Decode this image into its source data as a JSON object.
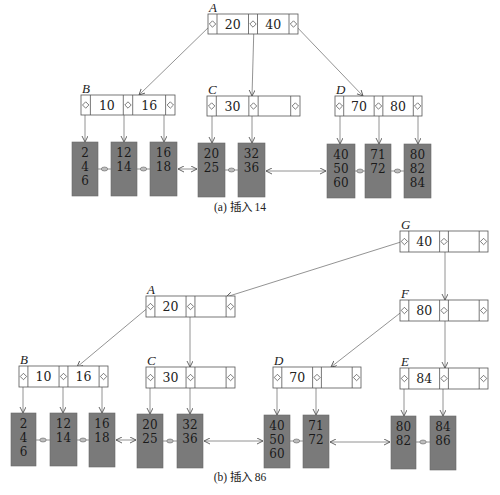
{
  "figure": {
    "parts": [
      {
        "id": "a",
        "caption": "(a) 插入 14",
        "caption_pos": [
          240,
          211
        ],
        "nodes": [
          {
            "name": "A",
            "x": 208,
            "y": 14,
            "w": 90,
            "h": 20,
            "keys": [
              "20",
              "40"
            ]
          },
          {
            "name": "B",
            "x": 81,
            "y": 95,
            "w": 94,
            "h": 20,
            "keys": [
              "10",
              "16"
            ]
          },
          {
            "name": "C",
            "x": 207,
            "y": 96,
            "w": 93,
            "h": 20,
            "keys": [
              "30",
              ""
            ]
          },
          {
            "name": "D",
            "x": 335,
            "y": 96,
            "w": 87,
            "h": 20,
            "keys": [
              "70",
              "80"
            ]
          }
        ],
        "leaves": [
          {
            "x": 72,
            "y": 142,
            "w": 26,
            "h": 54,
            "values": [
              "2",
              "4",
              "6"
            ]
          },
          {
            "x": 111,
            "y": 142,
            "w": 26,
            "h": 54,
            "values": [
              "12",
              "14"
            ]
          },
          {
            "x": 150,
            "y": 142,
            "w": 27,
            "h": 54,
            "values": [
              "16",
              "18"
            ]
          },
          {
            "x": 198,
            "y": 143,
            "w": 27,
            "h": 54,
            "values": [
              "20",
              "25"
            ]
          },
          {
            "x": 238,
            "y": 143,
            "w": 27,
            "h": 54,
            "values": [
              "32",
              "36"
            ]
          },
          {
            "x": 327,
            "y": 144,
            "w": 28,
            "h": 54,
            "values": [
              "40",
              "50",
              "60"
            ]
          },
          {
            "x": 365,
            "y": 144,
            "w": 26,
            "h": 54,
            "values": [
              "71",
              "72"
            ]
          },
          {
            "x": 404,
            "y": 144,
            "w": 27,
            "h": 54,
            "values": [
              "80",
              "82",
              "84"
            ]
          }
        ],
        "edges": [
          {
            "from": [
              212,
              24
            ],
            "to": [
              139,
              95
            ]
          },
          {
            "from": [
              254,
              24
            ],
            "to": [
              252,
              96
            ]
          },
          {
            "from": [
              294,
              24
            ],
            "to": [
              363,
              96
            ]
          },
          {
            "from": [
              85,
              105
            ],
            "to": [
              85,
              142
            ]
          },
          {
            "from": [
              124,
              105
            ],
            "to": [
              124,
              142
            ]
          },
          {
            "from": [
              164,
              105
            ],
            "to": [
              164,
              142
            ]
          },
          {
            "from": [
              212,
              106
            ],
            "to": [
              212,
              143
            ]
          },
          {
            "from": [
              252,
              106
            ],
            "to": [
              252,
              143
            ]
          },
          {
            "from": [
              340,
              106
            ],
            "to": [
              340,
              144
            ]
          },
          {
            "from": [
              379,
              106
            ],
            "to": [
              379,
              144
            ]
          },
          {
            "from": [
              418,
              106
            ],
            "to": [
              418,
              144
            ]
          }
        ],
        "sibling_links": [
          {
            "x1": 98,
            "x2": 111,
            "y": 169,
            "type": "dot"
          },
          {
            "x1": 137,
            "x2": 150,
            "y": 169,
            "type": "dot"
          },
          {
            "x1": 177,
            "x2": 198,
            "y": 169,
            "type": "arrows"
          },
          {
            "x1": 225,
            "x2": 238,
            "y": 170,
            "type": "dot"
          },
          {
            "x1": 265,
            "x2": 327,
            "y": 171,
            "type": "arrows"
          },
          {
            "x1": 355,
            "x2": 365,
            "y": 171,
            "type": "dot"
          },
          {
            "x1": 391,
            "x2": 404,
            "y": 171,
            "type": "dot"
          }
        ]
      },
      {
        "id": "b",
        "caption": "(b) 插入 86",
        "caption_pos": [
          240,
          481
        ],
        "nodes": [
          {
            "name": "G",
            "x": 400,
            "y": 231,
            "w": 88,
            "h": 21,
            "keys": [
              "40",
              ""
            ]
          },
          {
            "name": "A",
            "x": 146,
            "y": 296,
            "w": 89,
            "h": 21,
            "keys": [
              "20",
              ""
            ]
          },
          {
            "name": "F",
            "x": 400,
            "y": 300,
            "w": 88,
            "h": 21,
            "keys": [
              "80",
              ""
            ]
          },
          {
            "name": "B",
            "x": 19,
            "y": 366,
            "w": 89,
            "h": 21,
            "keys": [
              "10",
              "16"
            ]
          },
          {
            "name": "C",
            "x": 146,
            "y": 367,
            "w": 89,
            "h": 21,
            "keys": [
              "30",
              ""
            ]
          },
          {
            "name": "D",
            "x": 273,
            "y": 367,
            "w": 88,
            "h": 21,
            "keys": [
              "70",
              ""
            ]
          },
          {
            "name": "E",
            "x": 400,
            "y": 368,
            "w": 88,
            "h": 21,
            "keys": [
              "84",
              ""
            ]
          }
        ],
        "leaves": [
          {
            "x": 11,
            "y": 413,
            "w": 25,
            "h": 53,
            "values": [
              "2",
              "4",
              "6"
            ]
          },
          {
            "x": 50,
            "y": 413,
            "w": 27,
            "h": 53,
            "values": [
              "12",
              "14"
            ]
          },
          {
            "x": 89,
            "y": 413,
            "w": 26,
            "h": 54,
            "values": [
              "16",
              "18"
            ]
          },
          {
            "x": 137,
            "y": 414,
            "w": 26,
            "h": 54,
            "values": [
              "20",
              "25"
            ]
          },
          {
            "x": 177,
            "y": 414,
            "w": 26,
            "h": 54,
            "values": [
              "32",
              "36"
            ]
          },
          {
            "x": 264,
            "y": 415,
            "w": 26,
            "h": 53,
            "values": [
              "40",
              "50",
              "60"
            ]
          },
          {
            "x": 303,
            "y": 415,
            "w": 26,
            "h": 53,
            "values": [
              "71",
              "72"
            ]
          },
          {
            "x": 391,
            "y": 416,
            "w": 25,
            "h": 53,
            "values": [
              "80",
              "82"
            ]
          },
          {
            "x": 430,
            "y": 416,
            "w": 26,
            "h": 54,
            "values": [
              "84",
              "86"
            ]
          }
        ],
        "edges": [
          {
            "from": [
              404,
              241
            ],
            "to": [
              226,
              297
            ]
          },
          {
            "from": [
              445,
              241
            ],
            "to": [
              445,
              300
            ]
          },
          {
            "from": [
              150,
              306
            ],
            "to": [
              77,
              367
            ]
          },
          {
            "from": [
              190,
              306
            ],
            "to": [
              190,
              367
            ]
          },
          {
            "from": [
              404,
              310
            ],
            "to": [
              331,
              367
            ]
          },
          {
            "from": [
              445,
              310
            ],
            "to": [
              445,
              368
            ]
          },
          {
            "from": [
              23,
              377
            ],
            "to": [
              23,
              413
            ]
          },
          {
            "from": [
              63,
              377
            ],
            "to": [
              63,
              413
            ]
          },
          {
            "from": [
              102,
              377
            ],
            "to": [
              102,
              413
            ]
          },
          {
            "from": [
              150,
              377
            ],
            "to": [
              150,
              414
            ]
          },
          {
            "from": [
              190,
              377
            ],
            "to": [
              190,
              414
            ]
          },
          {
            "from": [
              277,
              378
            ],
            "to": [
              277,
              415
            ]
          },
          {
            "from": [
              316,
              378
            ],
            "to": [
              316,
              415
            ]
          },
          {
            "from": [
              404,
              379
            ],
            "to": [
              404,
              416
            ]
          },
          {
            "from": [
              443,
              379
            ],
            "to": [
              443,
              416
            ]
          }
        ],
        "sibling_links": [
          {
            "x1": 36,
            "x2": 50,
            "y": 440,
            "type": "dot"
          },
          {
            "x1": 77,
            "x2": 89,
            "y": 440,
            "type": "dot"
          },
          {
            "x1": 115,
            "x2": 137,
            "y": 440,
            "type": "arrows"
          },
          {
            "x1": 163,
            "x2": 177,
            "y": 441,
            "type": "dot"
          },
          {
            "x1": 203,
            "x2": 264,
            "y": 441,
            "type": "arrows"
          },
          {
            "x1": 290,
            "x2": 303,
            "y": 441,
            "type": "dot"
          },
          {
            "x1": 329,
            "x2": 391,
            "y": 442,
            "type": "arrows"
          },
          {
            "x1": 416,
            "x2": 430,
            "y": 442,
            "type": "dot"
          }
        ]
      }
    ]
  },
  "colors": {
    "leaf_fill": "#7a7a7a",
    "node_stroke": "#555555",
    "edge": "#777777"
  }
}
